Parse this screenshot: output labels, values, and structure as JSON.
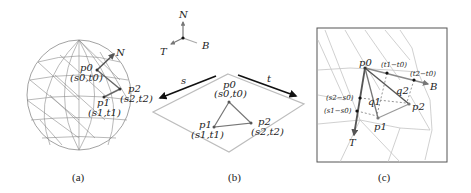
{
  "figure": {
    "panels": [
      {
        "id": "a",
        "caption": "(a)",
        "description": "Triangulated sphere mesh with a highlighted triangle and normal vector",
        "labels": {
          "normal": "N",
          "p0": "p0",
          "p0_uv": "(s0,t0)",
          "p1": "p1",
          "p1_uv": "(s1,t1)",
          "p2": "p2",
          "p2_uv": "(s2,t2)"
        }
      },
      {
        "id": "b",
        "caption": "(b)",
        "description": "Tangent frame axes and texture plane with triangle",
        "axes": {
          "N": "N",
          "T": "T",
          "B": "B"
        },
        "arrows": {
          "s": "s",
          "t": "t"
        },
        "labels": {
          "p0": "p0",
          "p0_uv": "(s0,t0)",
          "p1": "p1",
          "p1_uv": "(s1,t1)",
          "p2": "p2",
          "p2_uv": "(s2,t2)"
        }
      },
      {
        "id": "c",
        "caption": "(c)",
        "description": "Zoomed triangle with tangent T and bitangent B and projected edge differences",
        "labels": {
          "p0": "p0",
          "p1": "p1",
          "p2": "p2",
          "q1": "q1",
          "q2": "q2",
          "T": "T",
          "B": "B",
          "t1_t0": "(t1−t0)",
          "t2_t0": "(t2−t0)",
          "s2_s0": "(s2−s0)",
          "s1_s0": "(s1−s0)"
        }
      }
    ],
    "colors": {
      "mesh": "#8a8a8a",
      "mesh_light": "#c4c4c4",
      "highlight": "#6a6a6a",
      "arrow": "#111111",
      "plane": "#bdbdbd"
    }
  }
}
